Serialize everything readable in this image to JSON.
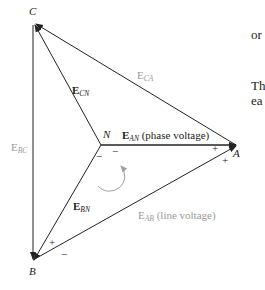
{
  "diagram": {
    "vertices": {
      "C": "C",
      "N": "N",
      "A": "A",
      "B": "B"
    },
    "vectors": {
      "ecn": {
        "main": "E",
        "sub": "CN",
        "suffix": ""
      },
      "eca": {
        "main": "E",
        "sub": "CA",
        "suffix": ""
      },
      "ean": {
        "main": "E",
        "sub": "AN",
        "suffix": " (phase voltage)"
      },
      "ebc": {
        "main": "E",
        "sub": "BC",
        "suffix": ""
      },
      "ebn": {
        "main": "E",
        "sub": "BN",
        "suffix": ""
      },
      "eab": {
        "main": "E",
        "sub": "AB",
        "suffix": " (line voltage)"
      }
    },
    "signs": {
      "n_minus_left": "−",
      "n_minus_right": "−",
      "a_plus_top": "+",
      "a_plus_bottom": "+",
      "b_plus": "+",
      "b_minus": "−"
    },
    "colors": {
      "phase_line": "#222222",
      "line_voltage_label": "#9a9a9a",
      "rotation_arrow": "#a0a0a0"
    }
  },
  "side_text": {
    "line1": "or",
    "line2": "Th",
    "line3": "ea"
  }
}
